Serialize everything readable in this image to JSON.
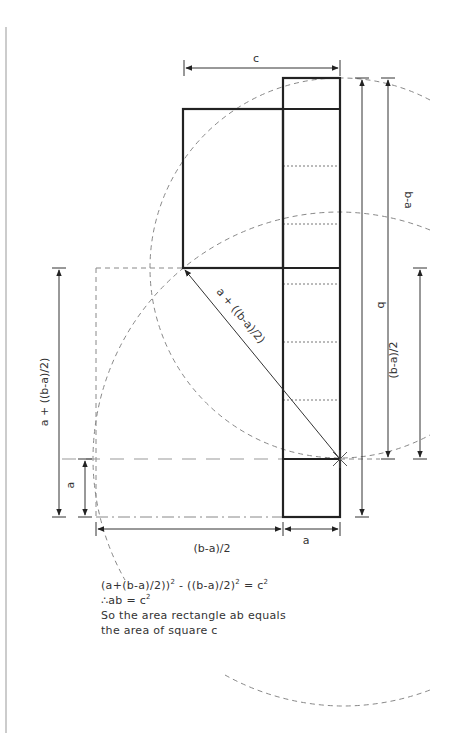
{
  "diagram": {
    "labels": {
      "c": "c",
      "b": "b",
      "b_minus_a": "b-a",
      "half_b_minus_a_right": "(b-a)/2",
      "half_b_minus_a_bottom": "(b-a)/2",
      "a_plus_half_left": "a + ((b-a)/2)",
      "a_plus_half_diagonal": "a + ((b-a)/2)",
      "a_left": "a",
      "a_bottom": "a"
    },
    "colors": {
      "ink": "#222222",
      "thin": "#555555",
      "dashed": "#888888",
      "text": "#333333"
    }
  },
  "caption": {
    "line1_main": "(a+(b-a)/2))",
    "line1_sup1": "2",
    "line1_mid": " - ((b-a)/2)",
    "line1_sup2": "2",
    "line1_end": " = c",
    "line1_sup3": "2",
    "line2_main": "∴ab = c",
    "line2_sup": "2",
    "line3": "So the area rectangle ab equals",
    "line4": "the area of square c"
  }
}
